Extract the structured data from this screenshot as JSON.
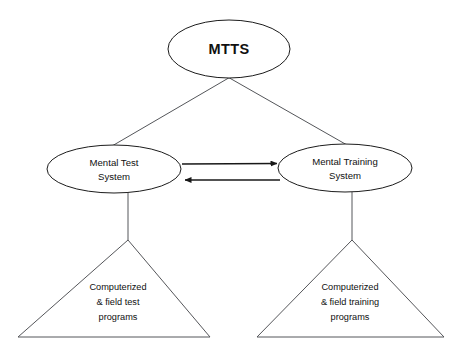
{
  "diagram": {
    "background_color": "#ffffff",
    "node_stroke_color": "#1c1c1c",
    "triangle_stroke_color": "#55565a",
    "connector_color": "#54565a",
    "arrow_color": "#181818",
    "text_color": "#101010",
    "root": {
      "id": "mtts",
      "shape": "ellipse",
      "label": "MTTS",
      "cx": 229,
      "cy": 49,
      "rx": 61,
      "ry": 29
    },
    "branches": [
      {
        "id": "mental-test-system",
        "shape": "ellipse",
        "label_line_1": "Mental Test",
        "label_line_2": "System",
        "cx": 114,
        "cy": 169,
        "rx": 67,
        "ry": 24
      },
      {
        "id": "mental-training-system",
        "shape": "ellipse",
        "label_line_1": "Mental Training",
        "label_line_2": "System",
        "cx": 345,
        "cy": 168,
        "rx": 67,
        "ry": 24
      }
    ],
    "leaves": [
      {
        "id": "computerized-field-test-programs",
        "shape": "triangle",
        "label_line_1": "Computerized",
        "label_line_2": "& field test",
        "label_line_3": "programs",
        "apex_x": 128,
        "apex_y": 240,
        "base_left_x": 18,
        "base_right_x": 210,
        "base_y": 337
      },
      {
        "id": "computerized-field-training-programs",
        "shape": "triangle",
        "label_line_1": "Computerized",
        "label_line_2": "& field training",
        "label_line_3": "programs",
        "apex_x": 352,
        "apex_y": 240,
        "base_left_x": 257,
        "base_right_x": 444,
        "base_y": 337
      }
    ],
    "arrows": [
      {
        "id": "test-to-training",
        "direction": "right",
        "from_x": 182,
        "to_x": 278,
        "y": 164
      },
      {
        "id": "training-to-test",
        "direction": "left",
        "from_x": 280,
        "to_x": 184,
        "y": 180
      }
    ]
  }
}
